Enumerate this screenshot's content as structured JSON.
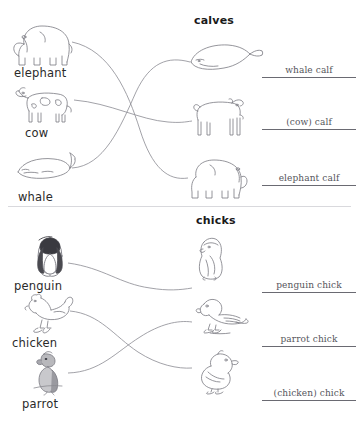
{
  "worksheet": {
    "background_color": "#ffffff",
    "line_color": "#7a7a82",
    "answer_color": "#55555c"
  },
  "sections": [
    {
      "id": "calves",
      "header": "calves",
      "parents": [
        {
          "label": "elephant",
          "icon": "elephant-icon"
        },
        {
          "label": "cow",
          "icon": "cow-icon"
        },
        {
          "label": "whale",
          "icon": "whale-icon"
        }
      ],
      "babies": [
        {
          "icon": "whale-calf-icon"
        },
        {
          "icon": "cow-calf-icon"
        },
        {
          "icon": "elephant-calf-icon"
        }
      ],
      "answers": [
        {
          "text": "whale calf"
        },
        {
          "text": "(cow) calf"
        },
        {
          "text": "elephant calf"
        }
      ],
      "matches": [
        {
          "from": "elephant",
          "to": "elephant calf"
        },
        {
          "from": "cow",
          "to": "(cow) calf"
        },
        {
          "from": "whale",
          "to": "whale calf"
        }
      ]
    },
    {
      "id": "chicks",
      "header": "chicks",
      "parents": [
        {
          "label": "penguin",
          "icon": "penguin-icon"
        },
        {
          "label": "chicken",
          "icon": "chicken-icon"
        },
        {
          "label": "parrot",
          "icon": "parrot-icon"
        }
      ],
      "babies": [
        {
          "icon": "penguin-chick-icon"
        },
        {
          "icon": "parrot-chick-icon"
        },
        {
          "icon": "chicken-chick-icon"
        }
      ],
      "answers": [
        {
          "text": "penguin chick"
        },
        {
          "text": "parrot chick"
        },
        {
          "text": "(chicken) chick"
        }
      ],
      "matches": [
        {
          "from": "penguin",
          "to": "penguin chick"
        },
        {
          "from": "chicken",
          "to": "(chicken) chick"
        },
        {
          "from": "parrot",
          "to": "parrot chick"
        }
      ]
    }
  ]
}
